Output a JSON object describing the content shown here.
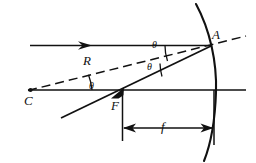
{
  "figure": {
    "type": "optics-ray-diagram",
    "stroke_color": "#111111",
    "background_color": "#ffffff"
  },
  "labels": {
    "vertex_A": "A",
    "center_C": "C",
    "focus_F": "F",
    "radius_R": "R",
    "focal_f": "f",
    "angle_upper": "θ",
    "angle_middle": "θ",
    "angle_lower": "θ"
  },
  "elements": {
    "incoming_ray": "incident-parallel-ray",
    "reflected_ray": "reflected-ray-through-focus",
    "radius_line": "dashed-radius-line-C-to-A",
    "optical_axis": "principal-axis",
    "mirror": "concave-mirror-arc",
    "focal_dimension": "focal-length-dimension-line"
  },
  "geometry": {
    "point_A": [
      210,
      45
    ],
    "point_C": [
      30,
      90
    ],
    "point_F": [
      122,
      90
    ],
    "axis_y": 90,
    "incident_ray_y": 45,
    "mirror_vertex_x": 215,
    "focal_dimension_y": 128,
    "focal_dimension_from_x": 122,
    "focal_dimension_to_x": 214
  }
}
